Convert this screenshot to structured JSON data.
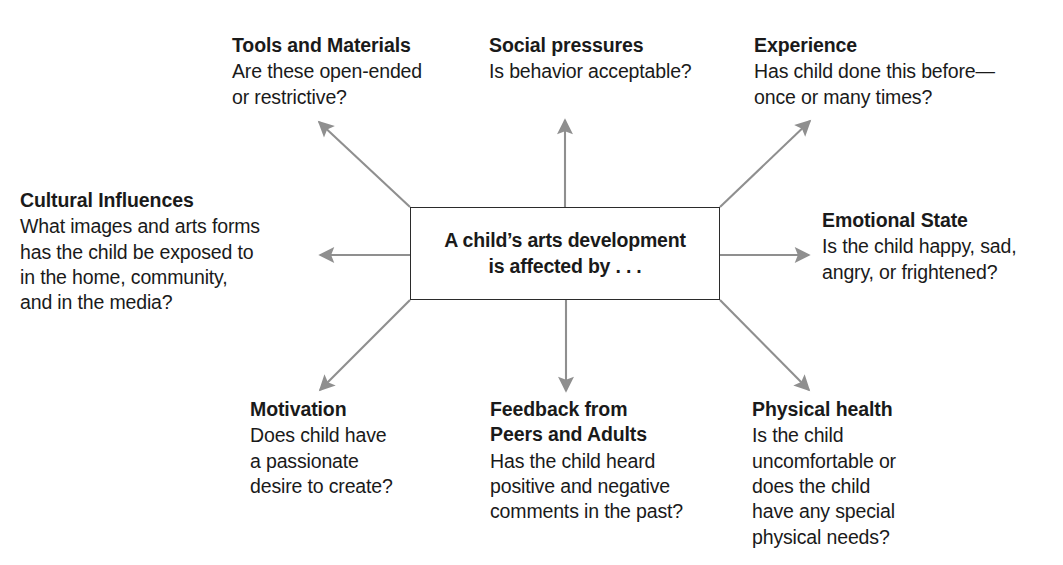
{
  "diagram": {
    "center": {
      "text": "A child’s arts development\nis affected by . . ."
    },
    "arrow_color": "#8f8f8f",
    "box_border_color": "#2b2b2b",
    "text_color": "#1a1a1a",
    "nodes": [
      {
        "id": "tools-and-materials",
        "title": "Tools and Materials",
        "body": "Are these open-ended\nor restrictive?"
      },
      {
        "id": "social-pressures",
        "title": "Social pressures",
        "body": "Is behavior acceptable?"
      },
      {
        "id": "experience",
        "title": "Experience",
        "body": "Has child done this before—\nonce or many times?"
      },
      {
        "id": "cultural-influences",
        "title": "Cultural Influences",
        "body": "What images and arts forms\nhas the child be exposed to\nin the home, community,\nand in the media?"
      },
      {
        "id": "emotional-state",
        "title": "Emotional State",
        "body": "Is the child happy, sad,\nangry, or frightened?"
      },
      {
        "id": "motivation",
        "title": "Motivation",
        "body": "Does child have\na passionate\ndesire to create?"
      },
      {
        "id": "feedback-from-peers-and-adults",
        "title": "Feedback from\nPeers and Adults",
        "body": "Has the child heard\npositive and negative\ncomments in the past?"
      },
      {
        "id": "physical-health",
        "title": "Physical health",
        "body": "Is the child\nuncomfortable or\ndoes the child\nhave any special\nphysical needs?"
      }
    ]
  }
}
